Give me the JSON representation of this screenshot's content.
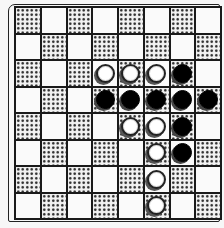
{
  "board": {
    "rows": 8,
    "cols": 8,
    "first_cell_shaded": true,
    "colors": {
      "light": "#fafafa",
      "dark_dots": "#2a2a2a",
      "line": "#1a1a1a"
    },
    "cells": [
      [
        "",
        "",
        "",
        "",
        "",
        "",
        "",
        ""
      ],
      [
        "",
        "",
        "",
        "",
        "",
        "",
        "",
        ""
      ],
      [
        "",
        "",
        "",
        "W",
        "W",
        "W",
        "B",
        ""
      ],
      [
        "",
        "",
        "",
        "B",
        "B",
        "B",
        "B",
        "B"
      ],
      [
        "",
        "",
        "",
        "",
        "W",
        "W",
        "B",
        ""
      ],
      [
        "",
        "",
        "",
        "",
        "",
        "W",
        "B",
        ""
      ],
      [
        "",
        "",
        "",
        "",
        "",
        "W",
        "",
        ""
      ],
      [
        "",
        "",
        "",
        "",
        "",
        "W",
        "",
        ""
      ]
    ]
  },
  "pieces": {
    "W": "white-disc",
    "B": "black-disc"
  }
}
